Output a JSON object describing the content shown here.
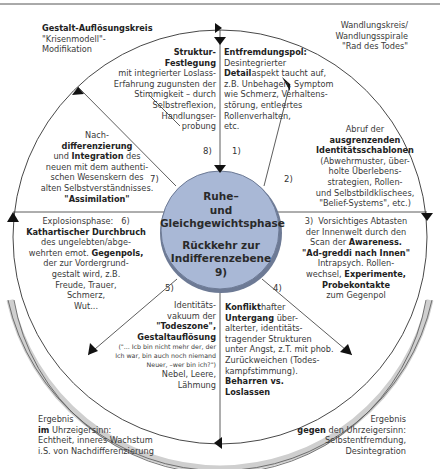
{
  "header_left": {
    "title": "Gestalt-Auflösungskreis",
    "subtitle_1": "\"Krisenmodell\"-",
    "subtitle_2": "Modifikation"
  },
  "header_right": {
    "line_1": "Wandlungskreis/",
    "line_2": "Wandlungsspirale",
    "line_3": "\"Rad des Todes\""
  },
  "center": {
    "line_1": "Ruhe–",
    "line_2": "und",
    "line_3": "Gleichgewichtsphase",
    "line_4": "Rückkehr zur",
    "line_5": "Indifferenzebene",
    "line_6": "9)"
  },
  "phases": [
    {
      "num": "1)",
      "lines": [
        {
          "b": "Entfremdungspol:",
          "t": ""
        },
        {
          "b": "",
          "t": "Desintegrierter"
        },
        {
          "b": "Detail",
          "t": "aspekt taucht auf,"
        },
        {
          "b": "",
          "t": "z.B. Unbehagen, Symptom"
        },
        {
          "b": "",
          "t": "wie Schmerz, Verhaltens-"
        },
        {
          "b": "",
          "t": "störung, entleertes"
        },
        {
          "b": "",
          "t": "Rollenverhalten,"
        },
        {
          "b": "",
          "t": "etc."
        }
      ]
    },
    {
      "num": "2)",
      "lines": [
        {
          "b": "",
          "t": "Abruf der"
        },
        {
          "b": "ausgrenzenden",
          "t": ""
        },
        {
          "b": "Identitätsschablonen",
          "t": ""
        },
        {
          "b": "",
          "t": "(Abwehrmuster, über-"
        },
        {
          "b": "",
          "t": "holte Überlebens-"
        },
        {
          "b": "",
          "t": "strategien, Rollen-"
        },
        {
          "b": "",
          "t": "und Selbstbildklischees,"
        },
        {
          "b": "",
          "t": "\"Belief-Systems\", etc.)"
        }
      ]
    },
    {
      "num": "3)",
      "lines": [
        {
          "b": "",
          "t": "Vorsichtiges Abtasten"
        },
        {
          "b": "",
          "t": "der Innenwelt durch den"
        },
        {
          "b": "",
          "t": "Scan der ",
          "b2": "Awareness."
        },
        {
          "b": "\"Ad-greddi nach Innen\"",
          "t": ""
        },
        {
          "b": "",
          "t": "Intrapsych. Rollen-"
        },
        {
          "b": "",
          "t": "wechsel, ",
          "b2": "Experimente,"
        },
        {
          "b": "Probekontakte",
          "t": ""
        },
        {
          "b": "",
          "t": "zum Gegenpol"
        }
      ]
    },
    {
      "num": "4)",
      "lines": [
        {
          "b": "Konflikt",
          "t": "hafter"
        },
        {
          "b": "Untergang",
          "t": " über-"
        },
        {
          "b": "",
          "t": "alterter, identitäts-"
        },
        {
          "b": "",
          "t": "tragender Strukturen"
        },
        {
          "b": "",
          "t": "unter Angst, z.T. mit phob."
        },
        {
          "b": "",
          "t": "Zurückweichen (Todes-"
        },
        {
          "b": "",
          "t": "kampfstimmung)."
        },
        {
          "b": "Beharren vs.",
          "t": ""
        },
        {
          "b": "Loslassen",
          "t": ""
        }
      ]
    },
    {
      "num": "5)",
      "lines": [
        {
          "b": "",
          "t": "Identitäts-"
        },
        {
          "b": "",
          "t": "vakuum der"
        },
        {
          "b": "\"Todeszone\",",
          "t": ""
        },
        {
          "b": "Gestaltauflösung",
          "t": ""
        },
        {
          "b": "",
          "t": "(\"... Icb bin nicht mehr der, der"
        },
        {
          "b": "",
          "t": "Ich war, bin auch noch niemand"
        },
        {
          "b": "",
          "t": "Neuer, –wer bin ich?\")"
        },
        {
          "b": "",
          "t": "Nebel, Leere,"
        },
        {
          "b": "",
          "t": "Lähmung"
        }
      ]
    },
    {
      "num": "6)",
      "lines": [
        {
          "b": "",
          "t": "Explosionsphase:"
        },
        {
          "b": "Kathartischer Durchbruch",
          "t": ""
        },
        {
          "b": "",
          "t": "des ungelebten/abge-"
        },
        {
          "b": "",
          "t": "wehrten emot. ",
          "b2": "Gegenpols,"
        },
        {
          "b": "",
          "t": "der zur Vordergrund-"
        },
        {
          "b": "",
          "t": "gestalt wird, z.B."
        },
        {
          "b": "",
          "t": "Freude, Trauer,"
        },
        {
          "b": "",
          "t": "Schmerz,"
        },
        {
          "b": "",
          "t": "Wut..."
        }
      ]
    },
    {
      "num": "7)",
      "lines": [
        {
          "b": "",
          "t": "Nach-"
        },
        {
          "b": "differenzierung",
          "t": ""
        },
        {
          "b": "",
          "t": "und ",
          "b2": "Integration",
          "t2": " des"
        },
        {
          "b": "",
          "t": "neuen mit dem authenti-"
        },
        {
          "b": "",
          "t": "schen Wesenskern des"
        },
        {
          "b": "",
          "t": "alten Selbstverständnisses."
        },
        {
          "b": "\"Assimilation\"",
          "t": ""
        }
      ]
    },
    {
      "num": "8)",
      "lines": [
        {
          "b": "Struktur-",
          "t": ""
        },
        {
          "b": "Festlegung",
          "t": ""
        },
        {
          "b": "",
          "t": "mit integrierter Loslass-"
        },
        {
          "b": "",
          "t": "Erfahrung zugunsten der"
        },
        {
          "b": "",
          "t": "Stimmigkeit – durch"
        },
        {
          "b": "",
          "t": "Selbstreflexion,"
        },
        {
          "b": "",
          "t": "Handlungser-"
        },
        {
          "b": "",
          "t": "probung"
        }
      ]
    }
  ],
  "footer_left": {
    "line_1": "Ergebnis",
    "line_2_bold": "im",
    "line_2_rest": " Uhrzeigersinn:",
    "line_3": "Echtheit, inneres Wachstum",
    "line_4": "i.S. von Nachdifferenzierung"
  },
  "footer_right": {
    "line_1": "Ergebnis",
    "line_2_bold": "gegen",
    "line_2_rest": " den Uhrzeigersinn:",
    "line_3": "Selbstentfremdung,",
    "line_4": "Desintegration"
  },
  "colors": {
    "center_fill": "#a9b8d6",
    "center_stroke": "#6d7a95",
    "ring_band": "#c8c8c8",
    "line": "#333333"
  }
}
